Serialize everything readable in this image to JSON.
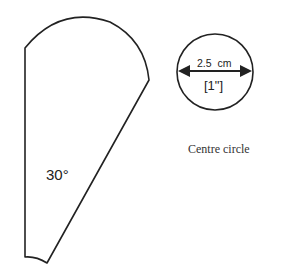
{
  "segment": {
    "angle_label": "30°"
  },
  "centre_circle": {
    "dimension_cm": "2.5  cm",
    "dimension_in": "[1\"]",
    "caption": "Centre circle"
  },
  "colors": {
    "stroke": "#222222",
    "background": "#ffffff"
  }
}
